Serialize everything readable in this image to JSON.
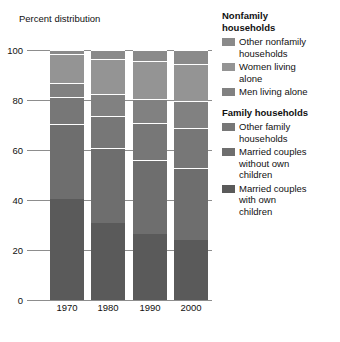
{
  "chart_data": {
    "type": "bar",
    "title": "Percent distribution",
    "xlabel": "",
    "ylabel": "",
    "ylim": [
      0,
      100
    ],
    "yticks": [
      0,
      20,
      40,
      60,
      80,
      100
    ],
    "grid": true,
    "stacked": true,
    "legend_position": "right",
    "categories": [
      "1970",
      "1980",
      "1990",
      "2000"
    ],
    "series": [
      {
        "name": "Married couples with own children",
        "group": "Family households",
        "color": "#5a5a5a",
        "values": [
          40.3,
          30.9,
          26.3,
          24.1
        ]
      },
      {
        "name": "Married couples without own children",
        "group": "Family households",
        "color": "#6e6e6e",
        "values": [
          30.3,
          29.9,
          29.8,
          28.7
        ]
      },
      {
        "name": "Other family households",
        "group": "Family households",
        "color": "#777777",
        "values": [
          10.6,
          12.9,
          14.8,
          16.0
        ]
      },
      {
        "name": "Men living alone",
        "group": "Nonfamily households",
        "color": "#818181",
        "values": [
          5.6,
          8.6,
          9.7,
          10.7
        ]
      },
      {
        "name": "Women living alone",
        "group": "Nonfamily households",
        "color": "#949494",
        "values": [
          11.5,
          14.0,
          14.9,
          14.8
        ]
      },
      {
        "name": "Other nonfamily households",
        "group": "Nonfamily households",
        "color": "#8a8a8a",
        "values": [
          1.7,
          3.6,
          4.6,
          5.7
        ]
      }
    ]
  },
  "legend": {
    "groups": [
      {
        "heading_line1": "Nonfamily",
        "heading_line2": "households",
        "items": [
          {
            "label_line1": "Other nonfamily",
            "label_line2": "households",
            "color": "#8a8a8a"
          },
          {
            "label_line1": "Women living",
            "label_line2": "alone",
            "color": "#949494"
          },
          {
            "label_line1": "Men living alone",
            "label_line2": "",
            "color": "#818181"
          }
        ]
      },
      {
        "heading_line1": "Family households",
        "heading_line2": "",
        "items": [
          {
            "label_line1": "Other family",
            "label_line2": "households",
            "color": "#777777"
          },
          {
            "label_line1": "Married couples",
            "label_line2": "without own",
            "label_line3": "children",
            "color": "#6e6e6e"
          },
          {
            "label_line1": "Married couples",
            "label_line2": "with own",
            "label_line3": "children",
            "color": "#5a5a5a"
          }
        ]
      }
    ]
  },
  "colors": {
    "gridline": "#8d8d8d",
    "background": "#ffffff",
    "text": "#111111",
    "bar_gap": "#ffffff"
  }
}
